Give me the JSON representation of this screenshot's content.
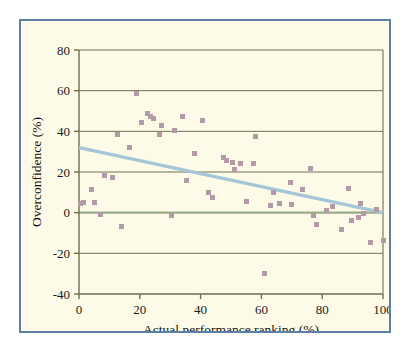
{
  "figure": {
    "background_color": "#fdfbe8",
    "border_color": "#5b7fa6",
    "page_background": "#ffffff"
  },
  "chart_data": {
    "type": "scatter",
    "title": "",
    "subtitle": "",
    "xlabel": "Actual performance ranking (%)",
    "ylabel": "Overconfidence (%)",
    "xlim": [
      0,
      100
    ],
    "ylim": [
      -40,
      80
    ],
    "xticks": [
      0,
      20,
      40,
      60,
      80,
      100
    ],
    "yticks": [
      -40,
      -20,
      0,
      20,
      40,
      60,
      80
    ],
    "xtick_labels": [
      "0",
      "20",
      "40",
      "60",
      "80",
      "100"
    ],
    "ytick_labels": [
      "-40",
      "-20",
      "0",
      "20",
      "40",
      "60",
      "80"
    ],
    "grid": "horizontal",
    "grid_color": "#6f6f52",
    "zero_line": true,
    "zero_line_color": "#9aab8a",
    "legend": "none",
    "marker_color": "#b39aa6",
    "marker_shape": "square",
    "series": [
      {
        "name": "Participants",
        "marker_color": "#b39aa6",
        "points": [
          [
            0.5,
            4.5
          ],
          [
            1.5,
            5.0
          ],
          [
            4.0,
            11.5
          ],
          [
            5.0,
            5.0
          ],
          [
            7.0,
            -1.0
          ],
          [
            8.5,
            18.5
          ],
          [
            11.0,
            17.5
          ],
          [
            12.5,
            38.5
          ],
          [
            14.0,
            -7.0
          ],
          [
            16.5,
            32.0
          ],
          [
            19.0,
            58.5
          ],
          [
            20.5,
            44.5
          ],
          [
            22.5,
            49.0
          ],
          [
            23.5,
            47.5
          ],
          [
            24.5,
            46.5
          ],
          [
            26.5,
            38.5
          ],
          [
            27.0,
            43.0
          ],
          [
            30.5,
            -1.5
          ],
          [
            31.5,
            40.5
          ],
          [
            34.0,
            47.5
          ],
          [
            35.5,
            16.0
          ],
          [
            38.0,
            29.0
          ],
          [
            40.5,
            45.5
          ],
          [
            42.5,
            10.0
          ],
          [
            44.0,
            7.5
          ],
          [
            47.5,
            27.0
          ],
          [
            48.5,
            25.5
          ],
          [
            50.5,
            24.5
          ],
          [
            51.0,
            21.0
          ],
          [
            53.0,
            24.0
          ],
          [
            55.0,
            5.5
          ],
          [
            57.5,
            24.0
          ],
          [
            58.0,
            37.5
          ],
          [
            61.0,
            -30.0
          ],
          [
            63.0,
            3.5
          ],
          [
            64.0,
            10.0
          ],
          [
            66.0,
            4.5
          ],
          [
            69.5,
            15.0
          ],
          [
            70.0,
            4.0
          ],
          [
            73.5,
            11.5
          ],
          [
            76.0,
            21.5
          ],
          [
            77.0,
            -1.5
          ],
          [
            78.0,
            -6.0
          ],
          [
            81.5,
            1.0
          ],
          [
            83.5,
            3.0
          ],
          [
            86.5,
            -8.5
          ],
          [
            88.5,
            12.0
          ],
          [
            89.5,
            -4.0
          ],
          [
            92.0,
            -2.5
          ],
          [
            92.5,
            4.5
          ],
          [
            93.5,
            -0.5
          ],
          [
            96.0,
            -14.5
          ],
          [
            98.0,
            1.5
          ],
          [
            100.0,
            -13.5
          ]
        ]
      }
    ],
    "trendline": {
      "name": "Linear fit",
      "color": "#a4c6d6",
      "x_start": 0,
      "y_start": 32.0,
      "x_end": 100,
      "y_end": 0.0
    }
  }
}
